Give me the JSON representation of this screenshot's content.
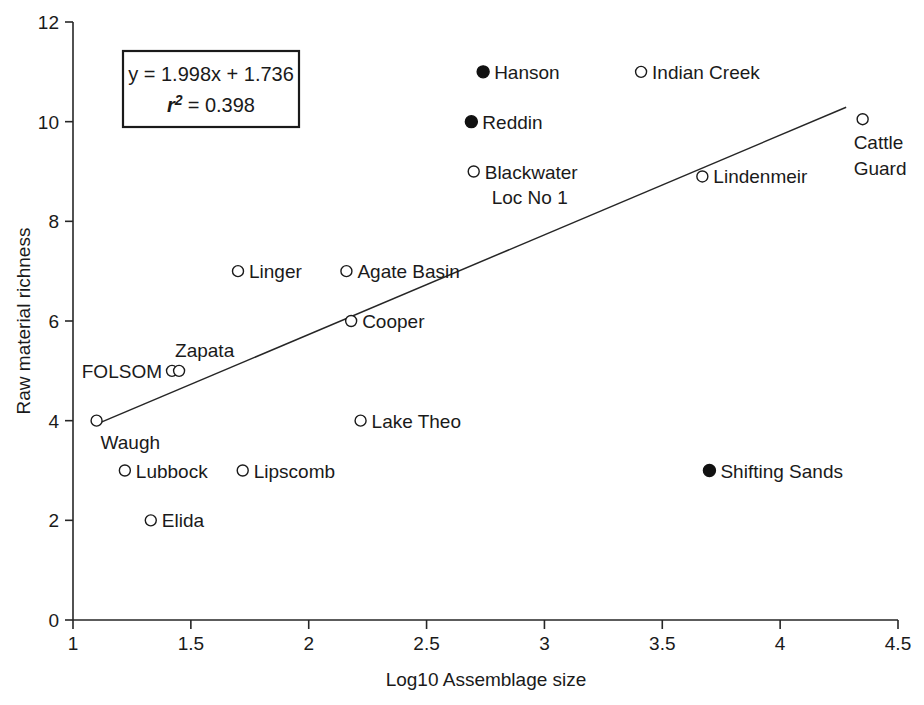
{
  "chart_data": {
    "type": "scatter",
    "title": "",
    "xlabel": "Log10 Assemblage size",
    "ylabel": "Raw material richness",
    "xlim": [
      1,
      4.5
    ],
    "ylim": [
      0,
      12
    ],
    "xticks": [
      "1",
      "1.5",
      "2",
      "2.5",
      "3",
      "3.5",
      "4",
      "4.5"
    ],
    "xtick_values": [
      1,
      1.5,
      2,
      2.5,
      3,
      3.5,
      4,
      4.5
    ],
    "yticks": [
      "0",
      "2",
      "4",
      "6",
      "8",
      "10",
      "12"
    ],
    "ytick_values": [
      0,
      2,
      4,
      6,
      8,
      10,
      12
    ],
    "grid": false,
    "legend_position": "none",
    "annotation": {
      "equation": "y = 1.998x + 1.736",
      "r_symbol": "r",
      "r_exponent": "2",
      "r_equals": "= 0.398",
      "r_squared_value": "0.398",
      "slope": 1.998,
      "intercept": 1.736
    },
    "trendline": {
      "x_start": 1.1,
      "y_start": 3.93,
      "x_end": 4.28,
      "y_end": 10.29
    },
    "points": [
      {
        "label": "Hanson",
        "x": 2.74,
        "y": 11,
        "marker": "filled",
        "label_pos": "right"
      },
      {
        "label": "Indian Creek",
        "x": 3.41,
        "y": 11,
        "marker": "open",
        "label_pos": "right"
      },
      {
        "label": "Reddin",
        "x": 2.69,
        "y": 10,
        "marker": "filled",
        "label_pos": "right"
      },
      {
        "label": "Cattle Guard",
        "x": 4.35,
        "y": 10.05,
        "marker": "open",
        "label_pos": "below"
      },
      {
        "label": "Blackwater Loc No 1",
        "x": 2.7,
        "y": 9,
        "marker": "open",
        "label_pos": "right2"
      },
      {
        "label": "Lindenmeir",
        "x": 3.67,
        "y": 8.9,
        "marker": "open",
        "label_pos": "right"
      },
      {
        "label": "Linger",
        "x": 1.7,
        "y": 7,
        "marker": "open",
        "label_pos": "right"
      },
      {
        "label": "Agate Basin",
        "x": 2.16,
        "y": 7,
        "marker": "open",
        "label_pos": "right"
      },
      {
        "label": "Cooper",
        "x": 2.18,
        "y": 6,
        "marker": "open",
        "label_pos": "right"
      },
      {
        "label": "FOLSOM",
        "x": 1.42,
        "y": 5,
        "marker": "open",
        "label_pos": "left"
      },
      {
        "label": "Zapata",
        "x": 1.45,
        "y": 5,
        "marker": "open",
        "label_pos": "above"
      },
      {
        "label": "Waugh",
        "x": 1.1,
        "y": 4,
        "marker": "open",
        "label_pos": "belowright"
      },
      {
        "label": "Lake Theo",
        "x": 2.22,
        "y": 4,
        "marker": "open",
        "label_pos": "right"
      },
      {
        "label": "Lubbock",
        "x": 1.22,
        "y": 3,
        "marker": "open",
        "label_pos": "right"
      },
      {
        "label": "Lipscomb",
        "x": 1.72,
        "y": 3,
        "marker": "open",
        "label_pos": "right"
      },
      {
        "label": "Shifting Sands",
        "x": 3.7,
        "y": 3,
        "marker": "filled",
        "label_pos": "right"
      },
      {
        "label": "Elida",
        "x": 1.33,
        "y": 2,
        "marker": "open",
        "label_pos": "right"
      }
    ]
  },
  "labels": {
    "blackwater_line1": "Blackwater",
    "blackwater_line2": "Loc No 1",
    "cattle_line1": "Cattle",
    "cattle_line2": "Guard"
  }
}
